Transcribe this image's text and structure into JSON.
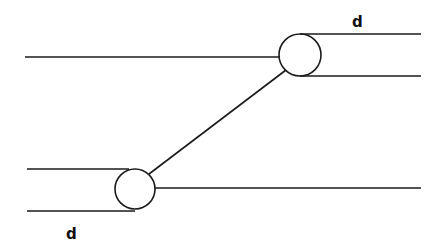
{
  "diagram": {
    "type": "line-offset-schematic",
    "stroke_color": "#1a1a1a",
    "labels": {
      "top_right": "d",
      "bottom_left": "d"
    },
    "elements": {
      "upper_left_line": {
        "x1": 25,
        "y1": 57,
        "x2": 280,
        "y2": 57
      },
      "upper_circle": {
        "cx": 300,
        "cy": 55,
        "r": 21
      },
      "upper_right_top_line": {
        "x1": 300,
        "y1": 34,
        "x2": 421,
        "y2": 34
      },
      "upper_right_bottom_line": {
        "x1": 300,
        "y1": 76,
        "x2": 421,
        "y2": 76
      },
      "diagonal_connector": {
        "x1": 149,
        "y1": 173,
        "x2": 285,
        "y2": 70
      },
      "lower_circle": {
        "cx": 135,
        "cy": 189,
        "r": 20
      },
      "lower_left_top_line": {
        "x1": 27,
        "y1": 169,
        "x2": 128,
        "y2": 169
      },
      "lower_left_bottom_line": {
        "x1": 27,
        "y1": 211,
        "x2": 135,
        "y2": 211
      },
      "lower_right_line": {
        "x1": 155,
        "y1": 188,
        "x2": 421,
        "y2": 188
      }
    }
  }
}
